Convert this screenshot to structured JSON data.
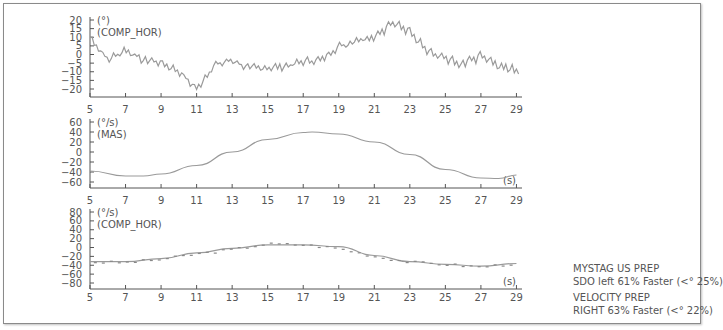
{
  "panels": [
    {
      "unit": "(°)",
      "name": "(COMP_HOR)",
      "yticks": [
        "20",
        "15",
        "10",
        "5",
        "0",
        "−5",
        "−10",
        "−15",
        "−20"
      ],
      "yvals": [
        20,
        15,
        10,
        5,
        0,
        -5,
        -10,
        -15,
        -20
      ],
      "xticks": [
        "5",
        "7",
        "9",
        "11",
        "13",
        "15",
        "17",
        "19",
        "21",
        "23",
        "25",
        "27",
        "29"
      ],
      "xlabel": ""
    },
    {
      "unit": "(°/s)",
      "name": "(MAS)",
      "yticks": [
        "60",
        "40",
        "20",
        "0",
        "−20",
        "−40",
        "−60"
      ],
      "yvals": [
        60,
        40,
        20,
        0,
        -20,
        -40,
        -60
      ],
      "xticks": [
        "5",
        "7",
        "9",
        "11",
        "13",
        "15",
        "17",
        "19",
        "21",
        "23",
        "25",
        "27",
        "29"
      ],
      "xlabel": "(s)"
    },
    {
      "unit": "(°/s)",
      "name": "(COMP_HOR)",
      "yticks": [
        "80",
        "60",
        "40",
        "20",
        "0",
        "−20",
        "−40",
        "−60",
        "−80"
      ],
      "yvals": [
        80,
        60,
        40,
        20,
        0,
        -20,
        -40,
        -60,
        -80
      ],
      "xticks": [
        "5",
        "7",
        "9",
        "11",
        "13",
        "15",
        "17",
        "19",
        "21",
        "23",
        "25",
        "27",
        "29"
      ],
      "xlabel": "(s)"
    }
  ],
  "legend": {
    "line1": "MYSTAG US PREP",
    "line2": "SDO left 61% Faster (<° 25%)",
    "line3": "VELOCITY PREP",
    "line4": "RIGHT 63% Faster (<° 22%)"
  },
  "chart_data": [
    {
      "type": "line",
      "title": "",
      "ylabel": "(°) (COMP_HOR)",
      "xlabel": "",
      "xlim": [
        5,
        29.2
      ],
      "ylim": [
        -22,
        20
      ],
      "x": [
        5,
        6,
        7,
        8,
        9,
        10,
        11,
        12,
        13,
        14,
        15,
        16,
        17,
        18,
        19,
        20,
        21,
        22,
        23,
        24,
        25,
        26,
        27,
        28,
        29
      ],
      "series": [
        {
          "name": "position",
          "values": [
            10,
            -3,
            3,
            -3,
            -5,
            -10,
            -20,
            -6,
            -3,
            -8,
            -8,
            -7,
            -4,
            -3,
            5,
            8,
            10,
            18,
            14,
            2,
            -2,
            -6,
            -1,
            -7,
            -9
          ]
        }
      ],
      "grid": false
    },
    {
      "type": "line",
      "title": "",
      "ylabel": "(°/s) (MAS)",
      "xlabel": "(s)",
      "xlim": [
        5,
        29.2
      ],
      "ylim": [
        -70,
        60
      ],
      "x": [
        5,
        7,
        8,
        9,
        11,
        13,
        15,
        17,
        17.5,
        19,
        21,
        23,
        25,
        27,
        28,
        29
      ],
      "series": [
        {
          "name": "MAS",
          "values": [
            -38,
            -48,
            -48,
            -44,
            -27,
            0,
            25,
            39,
            40,
            36,
            20,
            -5,
            -35,
            -52,
            -53,
            -46
          ]
        }
      ],
      "grid": false
    },
    {
      "type": "scatter",
      "title": "",
      "ylabel": "(°/s) (COMP_HOR)",
      "xlabel": "(s)",
      "xlim": [
        5,
        29.2
      ],
      "ylim": [
        -85,
        80
      ],
      "x": [
        5,
        7,
        9,
        11,
        13,
        15,
        17,
        19,
        21,
        23,
        25,
        27,
        29
      ],
      "series": [
        {
          "name": "fit",
          "values": [
            -32,
            -32,
            -25,
            -12,
            -2,
            6,
            6,
            2,
            -18,
            -32,
            -38,
            -42,
            -36
          ]
        },
        {
          "name": "points",
          "values": [
            -33,
            -34,
            -27,
            -15,
            -5,
            8,
            6,
            -2,
            -20,
            -33,
            -38,
            -44,
            -36
          ]
        }
      ],
      "grid": false
    }
  ]
}
